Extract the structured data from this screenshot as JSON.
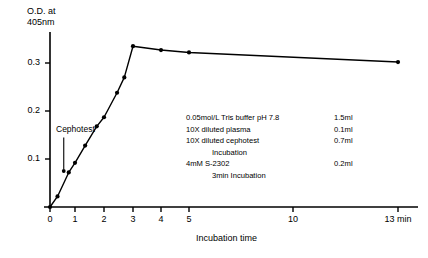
{
  "chart_data": {
    "type": "line",
    "title": "",
    "ylabel": "O.D. at\n405nm",
    "ylabel_line1": "O.D. at",
    "ylabel_line2": "405nm",
    "xlabel": "Incubation time",
    "xunit": "min",
    "ylim": [
      0,
      0.36
    ],
    "xlim": [
      -0.45,
      13.6
    ],
    "grid": false,
    "legend": "none",
    "yticks": [
      0.1,
      0.2,
      0.3
    ],
    "ytick_labels": [
      "0.1",
      "0.2",
      "0.3"
    ],
    "xticks": [
      0,
      1,
      2,
      3,
      4,
      5,
      10,
      13
    ],
    "xtick_labels": [
      "0",
      "1",
      "2",
      "3",
      "4",
      "5",
      "10",
      "13 min"
    ],
    "series": [
      {
        "name": "O.D. 405nm vs incubation time",
        "marker": "filled-circle",
        "x": [
          0,
          0.3,
          0.75,
          1.0,
          1.35,
          1.75,
          2.0,
          2.45,
          2.7,
          3.0,
          4.0,
          5.0,
          13.0
        ],
        "values": [
          0.0,
          0.022,
          0.072,
          0.092,
          0.128,
          0.168,
          0.187,
          0.238,
          0.27,
          0.335,
          0.327,
          0.322,
          0.302
        ]
      }
    ],
    "annotations": [
      {
        "name": "cephotest-arrow-label",
        "text": "Cephotest",
        "x": 0.55,
        "y": 0.155,
        "arrow": "down-to-0.075"
      }
    ]
  },
  "protocol": {
    "rows": [
      {
        "reagent": "0.05mol/L Tris buffer pH 7.8",
        "amount": "1.5ml"
      },
      {
        "reagent": "10X diluted plasma",
        "amount": "0.1ml"
      },
      {
        "reagent": "10X diluted cephotest",
        "amount": "0.7ml"
      },
      {
        "reagent": "Incubation",
        "amount": "",
        "centered": true
      },
      {
        "reagent": "4mM S-2302",
        "amount": "0.2ml"
      },
      {
        "reagent": "3min Incubation",
        "amount": "",
        "centered": true
      }
    ],
    "line1_reagent": "0.05mol/L Tris buffer pH 7.8",
    "line1_amount": "1.5ml",
    "line2_reagent": "10X diluted plasma",
    "line2_amount": "0.1ml",
    "line3_reagent": "10X diluted cephotest",
    "line3_amount": "0.7ml",
    "line4_reagent": "Incubation",
    "line5_reagent": "4mM S-2302",
    "line5_amount": "0.2ml",
    "line6_reagent": "3min Incubation"
  },
  "colors": {
    "axis": "#000000",
    "line": "#000000",
    "marker": "#000000",
    "background": "#ffffff"
  }
}
